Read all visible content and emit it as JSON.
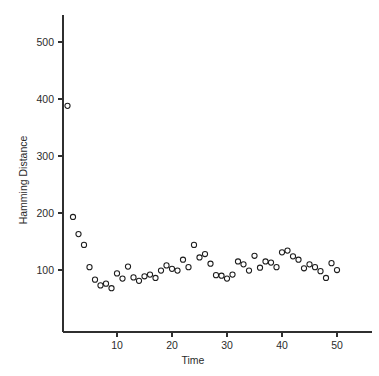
{
  "chart_data": {
    "type": "scatter",
    "title": "",
    "xlabel": "Time",
    "ylabel": "Hamming Distance",
    "xlim": [
      0,
      55
    ],
    "ylim": [
      0,
      545
    ],
    "grid": false,
    "legend": null,
    "marker": "open-circle",
    "xticks": [
      10,
      20,
      30,
      40,
      50
    ],
    "xtick_labels": [
      "10",
      "20",
      "30",
      "40",
      "50"
    ],
    "yticks": [
      100,
      200,
      300,
      400,
      500
    ],
    "ytick_labels": [
      "100",
      "200",
      "300",
      "400",
      "500"
    ],
    "series": [
      {
        "name": "Hamming Distance",
        "x": [
          1,
          2,
          3,
          4,
          5,
          6,
          7,
          8,
          9,
          10,
          11,
          12,
          13,
          14,
          15,
          16,
          17,
          18,
          19,
          20,
          21,
          22,
          23,
          24,
          25,
          26,
          27,
          28,
          29,
          30,
          31,
          32,
          33,
          34,
          35,
          36,
          37,
          38,
          39,
          40,
          41,
          42,
          43,
          44,
          45,
          46,
          47,
          48,
          49,
          50
        ],
        "y": [
          388,
          193,
          163,
          144,
          105,
          83,
          73,
          76,
          68,
          94,
          85,
          106,
          87,
          81,
          89,
          92,
          86,
          99,
          108,
          102,
          99,
          118,
          105,
          144,
          122,
          128,
          111,
          91,
          90,
          85,
          92,
          115,
          110,
          99,
          125,
          104,
          115,
          113,
          105,
          131,
          134,
          124,
          118,
          103,
          110,
          105,
          98,
          86,
          112,
          100
        ]
      }
    ]
  },
  "axes": {
    "y_label": "Hamming Distance",
    "x_label": "Time"
  }
}
